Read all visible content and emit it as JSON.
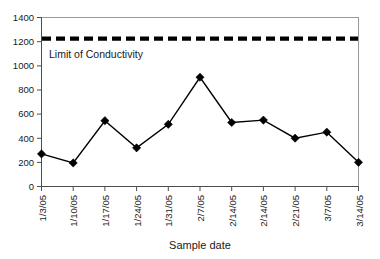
{
  "chart_data": {
    "type": "line",
    "title": "",
    "xlabel": "Sample date",
    "ylabel": "",
    "categories": [
      "1/3/05",
      "1/10/05",
      "1/17/05",
      "1/24/05",
      "1/31/05",
      "2/7/05",
      "2/14/05",
      "2/14/05",
      "2/21/05",
      "3/7/05",
      "3/14/05"
    ],
    "values": [
      270,
      195,
      545,
      320,
      515,
      905,
      530,
      550,
      400,
      450,
      200
    ],
    "series": [
      {
        "name": "Conductivity",
        "values": [
          270,
          195,
          545,
          320,
          515,
          905,
          530,
          550,
          400,
          450,
          200
        ]
      }
    ],
    "ylim": [
      0,
      1400
    ],
    "ytick_values": [
      0,
      200,
      400,
      600,
      800,
      1000,
      1200,
      1400
    ],
    "ytick_labels": [
      "0",
      "200",
      "400",
      "600",
      "800",
      "1000",
      "1200",
      "1400"
    ],
    "grid": false,
    "legend": "none",
    "marker": "diamond",
    "annotations": [
      {
        "label": "Limit of Conductivity",
        "value": 1225,
        "style": "dashed-horizontal-line"
      }
    ]
  },
  "colors": {
    "series": "#000000",
    "limit_line": "#000000",
    "plot_border": "#9a9a9a",
    "axis": "#4d4d4d",
    "background": "#ffffff",
    "text": "#1a1a1a"
  }
}
